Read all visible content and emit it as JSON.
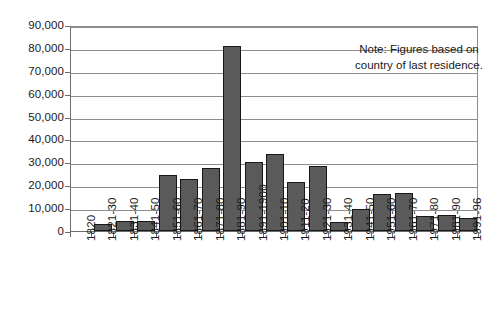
{
  "chart_data": {
    "type": "bar",
    "title": "",
    "xlabel": "",
    "ylabel": "",
    "ylim": [
      0,
      90000
    ],
    "grid": true,
    "legend": null,
    "categories": [
      "1820",
      "1821-30",
      "1831-40",
      "1841-50",
      "1851-60",
      "1861-70",
      "1871-80",
      "1881-90",
      "1891-1900",
      "1901-10",
      "1911-20",
      "1921-30",
      "1931-40",
      "1941-50",
      "1951-60",
      "1961-70",
      "1971-80",
      "1981-90",
      "1991-96"
    ],
    "values": [
      null,
      3000,
      4500,
      4300,
      24500,
      22700,
      27700,
      81000,
      30200,
      33500,
      21600,
      28200,
      4100,
      9600,
      16100,
      16800,
      6600,
      7000,
      5500
    ],
    "ytick_labels": [
      "90,000",
      "80,000",
      "70,000",
      "60,000",
      "50,000",
      "40,000",
      "30,000",
      "20,000",
      "10,000",
      "0"
    ],
    "ytick_values": [
      90000,
      80000,
      70000,
      60000,
      50000,
      40000,
      30000,
      20000,
      10000,
      0
    ],
    "annotations": [
      {
        "name": "source-note",
        "text": "Note: Figures based on country of last residence."
      }
    ]
  },
  "style": {
    "bar_fill": "#5a5a5a",
    "bar_stroke": "#171717",
    "gridline_color": "#8d8d8d",
    "axis_color": "#6d6d6d",
    "background": "#ffffff",
    "text_color": "#1a1a1a"
  }
}
